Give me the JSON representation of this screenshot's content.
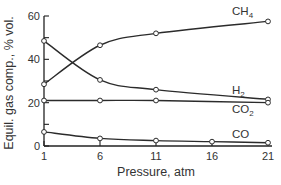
{
  "chart_data": {
    "type": "line",
    "title": "",
    "xlabel": "Pressure, atm",
    "ylabel": "Equil. gas comp., % vol.",
    "x": [
      1,
      6,
      11,
      16,
      21
    ],
    "xticks": [
      1,
      6,
      11,
      16,
      21
    ],
    "yticks": [
      0,
      20,
      40,
      60
    ],
    "xlim": [
      1,
      21
    ],
    "ylim": [
      0,
      60
    ],
    "grid": false,
    "legend": "inline labels at right end of each curve",
    "series": [
      {
        "name": "CH4",
        "label_main": "CH",
        "label_sub": "4",
        "x": [
          1,
          6,
          11,
          21
        ],
        "values": [
          28.5,
          46.5,
          52,
          57.5
        ]
      },
      {
        "name": "H2",
        "label_main": "H",
        "label_sub": "2",
        "x": [
          1,
          6,
          11,
          21
        ],
        "values": [
          48.5,
          30.5,
          26,
          21.5
        ]
      },
      {
        "name": "CO2",
        "label_main": "CO",
        "label_sub": "2",
        "x": [
          1,
          6,
          11,
          21
        ],
        "values": [
          21,
          21,
          21,
          20
        ]
      },
      {
        "name": "CO",
        "label_main": "CO",
        "label_sub": "",
        "x": [
          1,
          6,
          11,
          16,
          21
        ],
        "values": [
          6.5,
          3.5,
          2.5,
          2,
          1.5
        ]
      }
    ]
  }
}
